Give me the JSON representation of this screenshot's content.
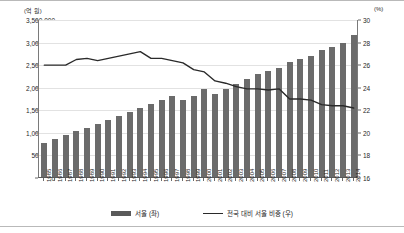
{
  "chart_data": {
    "type": "bar",
    "title": "",
    "xlabel": "",
    "ylabel": "",
    "left_axis": {
      "unit": "(억 원)",
      "min": 0,
      "max": 3500000,
      "step": 500000,
      "ticks": [
        "0",
        "500,000",
        "1,000,000",
        "1,500,000",
        "2,000,000",
        "2,500,000",
        "3,000,000",
        "3,500,000"
      ]
    },
    "right_axis": {
      "unit": "(%)",
      "min": 16,
      "max": 30,
      "step": 2,
      "ticks": [
        "16",
        "18",
        "20",
        "22",
        "24",
        "26",
        "28",
        "30"
      ]
    },
    "categories": [
      "1985",
      "1986",
      "1987",
      "1988",
      "1989",
      "1990",
      "1991",
      "1992",
      "1993",
      "1994",
      "1995",
      "1996",
      "1997",
      "1998",
      "1999",
      "2000",
      "2001",
      "2002",
      "2003",
      "2004",
      "2005",
      "2006",
      "2007",
      "2008",
      "2009",
      "2010",
      "2011",
      "2012",
      "2013",
      "2014"
    ],
    "series": [
      {
        "name": "서울 (좌)",
        "type": "bar",
        "axis": "left",
        "color": "#6b6b6b",
        "values": [
          750000,
          840000,
          930000,
          1010000,
          1090000,
          1180000,
          1270000,
          1350000,
          1430000,
          1530000,
          1620000,
          1700000,
          1790000,
          1700000,
          1800000,
          1940000,
          1840000,
          1960000,
          2070000,
          2180000,
          2290000,
          2350000,
          2420000,
          2540000,
          2610000,
          2680000,
          2810000,
          2880000,
          2960000,
          3150000
        ]
      },
      {
        "name": "전국 대비 서울 비중 (우)",
        "type": "line",
        "axis": "right",
        "color": "#2a2a2a",
        "values": [
          26.0,
          26.0,
          26.0,
          26.5,
          26.6,
          26.4,
          26.6,
          26.8,
          27.0,
          27.2,
          26.6,
          26.6,
          26.4,
          26.2,
          25.6,
          25.4,
          24.6,
          24.4,
          24.1,
          23.9,
          23.9,
          23.8,
          23.9,
          23.0,
          23.0,
          22.9,
          22.5,
          22.4,
          22.4,
          22.2
        ]
      }
    ],
    "legend_position": "bottom",
    "grid": true
  },
  "legend": {
    "bar_label": "서울 (좌)",
    "line_label": "전국 대비 서울 비중 (우)"
  }
}
